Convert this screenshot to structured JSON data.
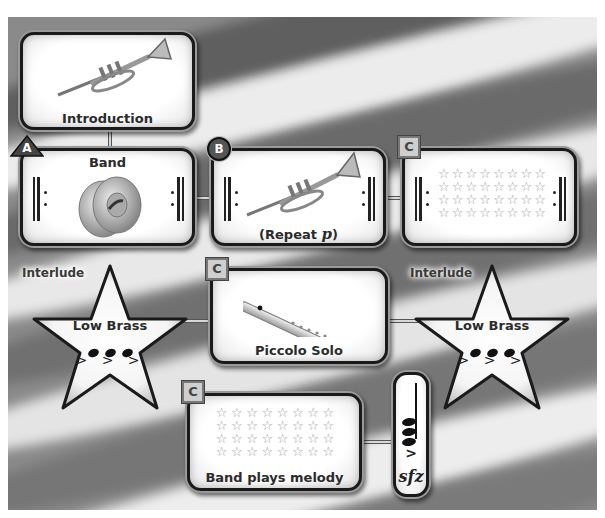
{
  "diagram": {
    "type": "music-form-map",
    "background": "waving-flag-stripes",
    "colors": {
      "box_fill": "#ffffff",
      "box_border": "#1a1a1a",
      "text": "#2b2b2b",
      "stripe_dark": "#6e6e6e",
      "stripe_light": "#e6e6e6",
      "star_outline": "#9a9a9a"
    }
  },
  "nodes": {
    "introduction": {
      "label": "Introduction",
      "icon": "trumpet-icon"
    },
    "section_a": {
      "badge": "A",
      "badge_shape": "triangle",
      "label": "Band",
      "icon": "cymbals-icon",
      "repeat_signs": true
    },
    "section_b": {
      "badge": "B",
      "badge_shape": "circle",
      "label_prefix": "(Repeat ",
      "dynamic": "p",
      "label_suffix": ")",
      "icon": "trumpet-icon",
      "repeat_signs": true
    },
    "section_c1": {
      "badge": "C",
      "badge_shape": "square",
      "stars": {
        "rows": 4,
        "cols": 8
      },
      "repeat_signs": true
    },
    "interlude_left": {
      "title": "Interlude",
      "label": "Low Brass",
      "notes": 3,
      "accents": "> > >"
    },
    "section_c2": {
      "badge": "C",
      "badge_shape": "square",
      "label": "Piccolo Solo",
      "icon": "piccolo-icon"
    },
    "interlude_right": {
      "title": "Interlude",
      "label": "Low Brass",
      "notes": 3,
      "accents": "> > >"
    },
    "section_c3": {
      "badge": "C",
      "badge_shape": "square",
      "stars": {
        "rows": 4,
        "cols": 8
      },
      "label": "Band plays melody"
    },
    "coda": {
      "notes": 3,
      "accent": ">",
      "dynamic": "sfz"
    }
  },
  "star_glyph": "☆"
}
